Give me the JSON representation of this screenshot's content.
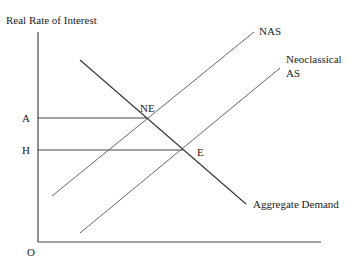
{
  "diagram": {
    "y_axis_label": "Real Rate of Interest",
    "origin_label": "O",
    "y_ticks": [
      {
        "label": "A",
        "y": 118
      },
      {
        "label": "H",
        "y": 150
      }
    ],
    "curves": {
      "nas": {
        "label": "NAS",
        "x1": 52,
        "y1": 196,
        "x2": 254,
        "y2": 32
      },
      "neoclassical_as": {
        "label_line1": "Neoclassical",
        "label_line2": "AS",
        "x1": 80,
        "y1": 233,
        "x2": 280,
        "y2": 68
      },
      "aggregate_demand": {
        "label": "Aggregate Demand",
        "x1": 80,
        "y1": 60,
        "x2": 246,
        "y2": 204
      }
    },
    "points": {
      "ne": {
        "label": "NE",
        "x": 147,
        "y": 118
      },
      "e": {
        "label": "E",
        "x": 183,
        "y": 150
      }
    },
    "colors": {
      "axis": "#444444",
      "line": "#555555",
      "text": "#222222"
    }
  }
}
